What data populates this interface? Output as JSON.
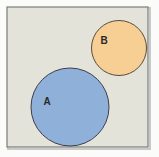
{
  "diagram": {
    "type": "venn",
    "relationship": "disjoint",
    "universe": {
      "fill": "#e4e3da",
      "stroke": "#7a7a7a"
    },
    "sets": [
      {
        "label": "A",
        "fill": "#8fb0d9",
        "stroke": "#3c3f4a"
      },
      {
        "label": "B",
        "fill": "#f7cf95",
        "stroke": "#5a4a38"
      }
    ]
  }
}
